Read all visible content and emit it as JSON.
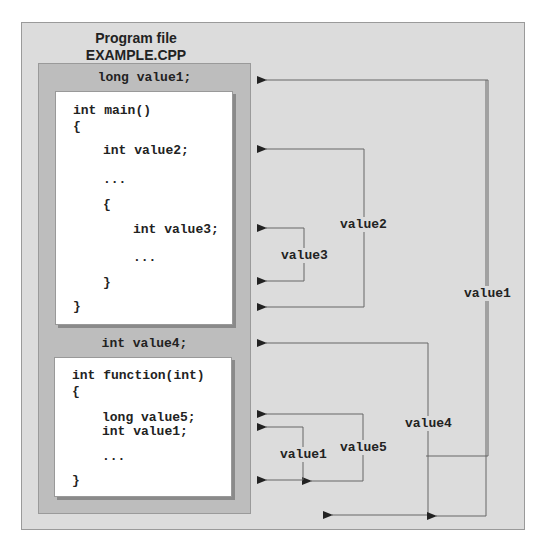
{
  "title": {
    "line1": "Program file",
    "line2": "EXAMPLE.CPP"
  },
  "global_decls": {
    "first": "long value1;",
    "second": "int value4;"
  },
  "main_block": {
    "lines": [
      {
        "text": "int main()",
        "indent": 0
      },
      {
        "text": "{",
        "indent": 0
      },
      {
        "text": "int value2;",
        "indent": 1
      },
      {
        "text": "...",
        "indent": 1
      },
      {
        "text": "{",
        "indent": 1
      },
      {
        "text": "int value3;",
        "indent": 2
      },
      {
        "text": "...",
        "indent": 2
      },
      {
        "text": "}",
        "indent": 1
      },
      {
        "text": "}",
        "indent": 0
      }
    ]
  },
  "function_block": {
    "lines": [
      {
        "text": "int function(int)",
        "indent": 0
      },
      {
        "text": "{",
        "indent": 0
      },
      {
        "text": "long value5;",
        "indent": 1
      },
      {
        "text": "int value1;",
        "indent": 1
      },
      {
        "text": "...",
        "indent": 1
      },
      {
        "text": "}",
        "indent": 0
      }
    ]
  },
  "scope_labels": {
    "value1_global": "value1",
    "value2": "value2",
    "value3": "value3",
    "value4": "value4",
    "value5": "value5",
    "value1_local": "value1"
  },
  "colors": {
    "outer_bg": "#dcdcdc",
    "scope_bg": "#bdbdbd",
    "code_bg": "#ffffff",
    "line": "#555555"
  }
}
